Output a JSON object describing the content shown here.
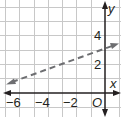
{
  "graph": {
    "x_axis_label": "x",
    "y_axis_label": "y",
    "origin_label": "O",
    "x_tick_labels": [
      "−6",
      "−4",
      "−2"
    ],
    "x_tick_values": [
      -6,
      -4,
      -2
    ],
    "y_tick_labels": [
      "2",
      "4"
    ],
    "y_tick_values": [
      2,
      4
    ],
    "x_range": [
      -7,
      0.6
    ],
    "y_range": [
      -1.7,
      6.5
    ],
    "grid_color": "#c8c8c8",
    "axis_color": "#231f20",
    "line_color": "#6d6e71",
    "line": {
      "style": "dashed",
      "slope": 0.3333,
      "y_intercept": 3,
      "equation": "y = (1/3)x + 3",
      "arrows": "both"
    }
  }
}
